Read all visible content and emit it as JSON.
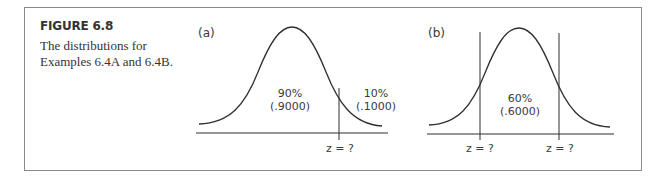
{
  "figure": {
    "title": "FIGURE 6.8",
    "caption_lines": [
      "The distributions for",
      "Examples 6.4A and 6.4B."
    ]
  },
  "panels": {
    "a": {
      "label": "(a)",
      "center_area_pct": "90%",
      "center_area_prop": "(.9000)",
      "tail_area_pct": "10%",
      "tail_area_prop": "(.1000)",
      "z_label": "z = ?"
    },
    "b": {
      "label": "(b)",
      "center_area_pct": "60%",
      "center_area_prop": "(.6000)",
      "z_label_left": "z = ?",
      "z_label_right": "z = ?"
    }
  },
  "colors": {
    "line": "#2e2e2e",
    "frame": "#8a8a8a",
    "text": "#333333"
  }
}
